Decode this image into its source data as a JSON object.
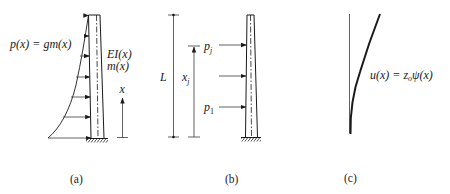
{
  "figure": {
    "colors": {
      "ink": "#1a1a1a",
      "thin": "#3a3a3a",
      "background": "#ffffff"
    },
    "panel_a": {
      "caption": "(a)",
      "load_label": "p(x) = gm(x)",
      "stiffness_label": "EI(x)",
      "mass_label": "m(x)",
      "axis_label": "x"
    },
    "panel_b": {
      "caption": "(b)",
      "height_label": "L",
      "position_label_main": "x",
      "position_label_sub": "j",
      "load_top_main": "p",
      "load_top_sub": "j",
      "load_bottom_main": "p",
      "load_bottom_sub": "1"
    },
    "panel_c": {
      "caption": "(c)",
      "shape_label": "u(x) = z",
      "shape_label_sub": "o",
      "shape_label_tail": "ψ(x)"
    }
  }
}
